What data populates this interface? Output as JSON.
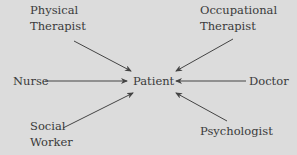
{
  "diagram": {
    "center": {
      "label": "Patient"
    },
    "nodes": [
      {
        "id": "physical-therapist",
        "line1": "Physical",
        "line2": "Therapist"
      },
      {
        "id": "occupational-therapist",
        "line1": "Occupational",
        "line2": "Therapist"
      },
      {
        "id": "nurse",
        "line1": "Nurse"
      },
      {
        "id": "doctor",
        "line1": "Doctor"
      },
      {
        "id": "social-worker",
        "line1": "Social",
        "line2": "Worker"
      },
      {
        "id": "psychologist",
        "line1": "Psychologist"
      }
    ],
    "edges": [
      {
        "from": "Physical Therapist",
        "to": "Patient"
      },
      {
        "from": "Occupational Therapist",
        "to": "Patient"
      },
      {
        "from": "Nurse",
        "to": "Patient"
      },
      {
        "from": "Doctor",
        "to": "Patient"
      },
      {
        "from": "Social Worker",
        "to": "Patient"
      },
      {
        "from": "Psychologist",
        "to": "Patient"
      }
    ],
    "colors": {
      "background": "#dcdcdc",
      "text": "#3a3a3a",
      "line": "#444444"
    }
  }
}
